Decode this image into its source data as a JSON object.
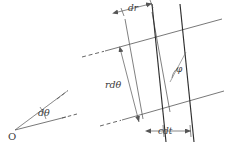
{
  "figure": {
    "background_color": "#ffffff",
    "width": 228,
    "height": 144,
    "line_color": "#555555",
    "heavy_line_color": "#333333",
    "label_color": "#3a3a3a"
  },
  "inset_angle": {
    "vertex_label": "O",
    "angle_label": "dθ",
    "description": "Small angle dθ subtended at origin O between two dashed rays",
    "vertex_point": [
      14,
      131
    ],
    "upper_ray_end": [
      64,
      93
    ],
    "lower_ray_end": [
      74,
      117
    ]
  },
  "main_figure": {
    "labels": {
      "dr": "dr",
      "rdtheta": "rdθ",
      "phi": "φ",
      "cdt": "cdt"
    },
    "elements": [
      "upper wavefront line with dashed extension to the left",
      "lower wavefront line with dashed extension to the left",
      "left ray line (thin)",
      "second ray line (thin)",
      "third ray line (heavy)",
      "right ray line (heavy)",
      "dr dimension arrows at top",
      "rdθ vertical dimension arrow at left",
      "cdt dimension arrows at bottom",
      "φ angle arc between heavy ray and thin ray"
    ]
  }
}
